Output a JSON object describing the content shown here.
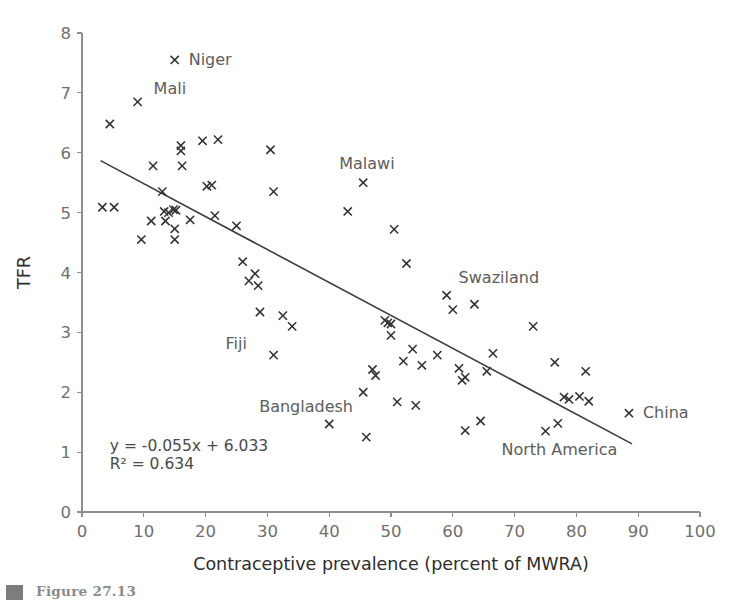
{
  "figure": {
    "caption_marker": "figure-bullet",
    "caption_text": "Figure 27.13"
  },
  "chart_data": {
    "type": "scatter",
    "title": "",
    "xlabel": "Contraceptive prevalence (percent of MWRA)",
    "ylabel": "TFR",
    "xlim": [
      0,
      100
    ],
    "ylim": [
      0,
      8
    ],
    "xticks": [
      0,
      10,
      20,
      30,
      40,
      50,
      60,
      70,
      80,
      90,
      100
    ],
    "yticks": [
      0,
      1,
      2,
      3,
      4,
      5,
      6,
      7,
      8
    ],
    "grid": false,
    "legend": "none",
    "marker": "x",
    "marker_color": "#323232",
    "trendline": {
      "equation": "y = -0.055x + 6.033",
      "r_squared": "R² = 0.634",
      "slope": -0.055,
      "intercept": 6.033,
      "x_start": 3,
      "x_end": 89,
      "color": "#3c3c3c"
    },
    "annotations": [
      {
        "label": "Niger",
        "x": 15.0,
        "y": 7.55,
        "dx": 14,
        "dy": 5
      },
      {
        "label": "Mali",
        "x": 9.0,
        "y": 6.85,
        "dx": 16,
        "dy": -8
      },
      {
        "label": "Malawi",
        "x": 45.5,
        "y": 5.5,
        "dx": -24,
        "dy": -14
      },
      {
        "label": "Swaziland",
        "x": 59.0,
        "y": 3.62,
        "dx": 12,
        "dy": -12
      },
      {
        "label": "Fiji",
        "x": 31.0,
        "y": 2.62,
        "dx": -48,
        "dy": -6
      },
      {
        "label": "Bangladesh",
        "x": 45.5,
        "y": 2.0,
        "dx": -104,
        "dy": 20
      },
      {
        "label": "North America",
        "x": 75.0,
        "y": 1.35,
        "dx": -44,
        "dy": 24
      },
      {
        "label": "China",
        "x": 88.5,
        "y": 1.65,
        "dx": 14,
        "dy": 5
      }
    ],
    "points": [
      {
        "x": 4.5,
        "y": 6.48
      },
      {
        "x": 9.0,
        "y": 6.85
      },
      {
        "x": 15.0,
        "y": 7.55
      },
      {
        "x": 3.3,
        "y": 5.09
      },
      {
        "x": 5.2,
        "y": 5.09
      },
      {
        "x": 9.6,
        "y": 4.55
      },
      {
        "x": 11.5,
        "y": 5.78
      },
      {
        "x": 11.2,
        "y": 4.86
      },
      {
        "x": 13.0,
        "y": 5.35
      },
      {
        "x": 13.3,
        "y": 5.02
      },
      {
        "x": 14.0,
        "y": 5.0
      },
      {
        "x": 14.8,
        "y": 5.05
      },
      {
        "x": 15.2,
        "y": 5.04
      },
      {
        "x": 16.0,
        "y": 6.12
      },
      {
        "x": 16.0,
        "y": 6.03
      },
      {
        "x": 16.2,
        "y": 5.78
      },
      {
        "x": 15.0,
        "y": 4.73
      },
      {
        "x": 15.0,
        "y": 4.55
      },
      {
        "x": 13.5,
        "y": 4.86
      },
      {
        "x": 19.5,
        "y": 6.2
      },
      {
        "x": 20.2,
        "y": 5.44
      },
      {
        "x": 21.0,
        "y": 5.46
      },
      {
        "x": 21.5,
        "y": 4.95
      },
      {
        "x": 22.0,
        "y": 6.22
      },
      {
        "x": 17.5,
        "y": 4.88
      },
      {
        "x": 25.0,
        "y": 4.78
      },
      {
        "x": 26.0,
        "y": 4.18
      },
      {
        "x": 27.0,
        "y": 3.86
      },
      {
        "x": 28.0,
        "y": 3.98
      },
      {
        "x": 28.5,
        "y": 3.78
      },
      {
        "x": 28.8,
        "y": 3.34
      },
      {
        "x": 30.5,
        "y": 6.05
      },
      {
        "x": 31.0,
        "y": 5.35
      },
      {
        "x": 31.0,
        "y": 2.62
      },
      {
        "x": 32.5,
        "y": 3.28
      },
      {
        "x": 34.0,
        "y": 3.1
      },
      {
        "x": 40.0,
        "y": 1.47
      },
      {
        "x": 43.0,
        "y": 5.02
      },
      {
        "x": 45.5,
        "y": 5.5
      },
      {
        "x": 45.5,
        "y": 2.0
      },
      {
        "x": 46.0,
        "y": 1.25
      },
      {
        "x": 47.0,
        "y": 2.38
      },
      {
        "x": 47.5,
        "y": 2.28
      },
      {
        "x": 49.0,
        "y": 3.2
      },
      {
        "x": 49.5,
        "y": 3.16
      },
      {
        "x": 50.0,
        "y": 3.14
      },
      {
        "x": 50.0,
        "y": 2.95
      },
      {
        "x": 50.5,
        "y": 4.72
      },
      {
        "x": 51.0,
        "y": 1.84
      },
      {
        "x": 52.0,
        "y": 2.52
      },
      {
        "x": 52.5,
        "y": 4.15
      },
      {
        "x": 53.5,
        "y": 2.72
      },
      {
        "x": 54.0,
        "y": 1.78
      },
      {
        "x": 55.0,
        "y": 2.45
      },
      {
        "x": 57.5,
        "y": 2.62
      },
      {
        "x": 59.0,
        "y": 3.62
      },
      {
        "x": 60.0,
        "y": 3.38
      },
      {
        "x": 61.0,
        "y": 2.4
      },
      {
        "x": 61.5,
        "y": 2.2
      },
      {
        "x": 62.0,
        "y": 2.25
      },
      {
        "x": 62.0,
        "y": 1.36
      },
      {
        "x": 63.5,
        "y": 3.47
      },
      {
        "x": 64.5,
        "y": 1.52
      },
      {
        "x": 65.5,
        "y": 2.35
      },
      {
        "x": 66.5,
        "y": 2.65
      },
      {
        "x": 73.0,
        "y": 3.1
      },
      {
        "x": 75.0,
        "y": 1.35
      },
      {
        "x": 76.5,
        "y": 2.5
      },
      {
        "x": 77.0,
        "y": 1.48
      },
      {
        "x": 78.0,
        "y": 1.92
      },
      {
        "x": 78.8,
        "y": 1.88
      },
      {
        "x": 80.5,
        "y": 1.93
      },
      {
        "x": 81.5,
        "y": 2.35
      },
      {
        "x": 82.0,
        "y": 1.85
      },
      {
        "x": 88.5,
        "y": 1.65
      }
    ]
  }
}
